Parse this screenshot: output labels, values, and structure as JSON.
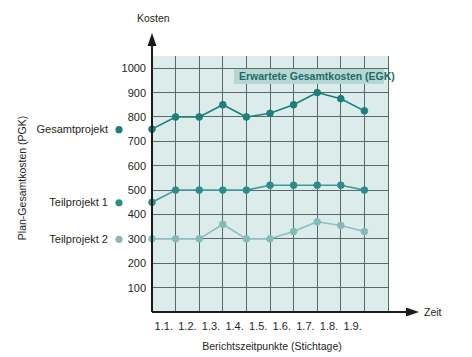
{
  "chart_data": {
    "type": "line",
    "title": "",
    "xlabel": "Berichtszeitpunkte (Stichtage)",
    "ylabel": "Plan-Gesamtkosten (PGK)",
    "x_axis_name": "Zeit",
    "y_axis_name": "Kosten",
    "categories": [
      "",
      "1.1.",
      "1.2.",
      "1.3.",
      "1.4.",
      "1.5.",
      "1.6.",
      "1.7.",
      "1.8.",
      "1.9."
    ],
    "xtick_labels": [
      "1.1.",
      "1.2.",
      "1.3.",
      "1.4.",
      "1.5.",
      "1.6.",
      "1.7.",
      "1.8.",
      "1.9."
    ],
    "ytick_labels": [
      "100",
      "200",
      "300",
      "400",
      "500",
      "600",
      "700",
      "800",
      "900",
      "1000"
    ],
    "ytick_values": [
      100,
      200,
      300,
      400,
      500,
      600,
      700,
      800,
      900,
      1000
    ],
    "ylim": [
      0,
      1050
    ],
    "grid": true,
    "legend_position": "left-outside",
    "plot_background": "#dcecea",
    "series": [
      {
        "name": "Gesamtprojekt",
        "color": "#1b7f7c",
        "marker_color": "#1b7f7c",
        "values": [
          750,
          800,
          800,
          850,
          800,
          815,
          850,
          900,
          875,
          825
        ]
      },
      {
        "name": "Teilprojekt 1",
        "color": "#3f9b96",
        "marker_color": "#2d8c88",
        "values": [
          450,
          500,
          500,
          500,
          500,
          520,
          520,
          520,
          520,
          500
        ]
      },
      {
        "name": "Teilprojekt 2",
        "color": "#8dbfbc",
        "marker_color": "#84bbb8",
        "values": [
          300,
          300,
          300,
          360,
          300,
          300,
          330,
          370,
          355,
          330
        ]
      }
    ],
    "annotations": [
      {
        "text": "Erwartete Gesamtkosten (EGK)",
        "color": "#1b6b68",
        "background": "#b6d6d4",
        "at_value": 960
      }
    ]
  },
  "legend": {
    "items": [
      {
        "label": "Gesamtprojekt",
        "color": "#1b7f7c"
      },
      {
        "label": "Teilprojekt 1",
        "color": "#2d8c88"
      },
      {
        "label": "Teilprojekt 2",
        "color": "#84bbb8"
      }
    ]
  },
  "colors": {
    "axis": "#1a1a1a",
    "grid": "#5a6a6a",
    "plot_bg": "#dcecea",
    "series_dark": "#1b7f7c",
    "series_mid": "#2d8c88",
    "series_light": "#84bbb8",
    "annotation_bg": "#b6d6d4"
  }
}
